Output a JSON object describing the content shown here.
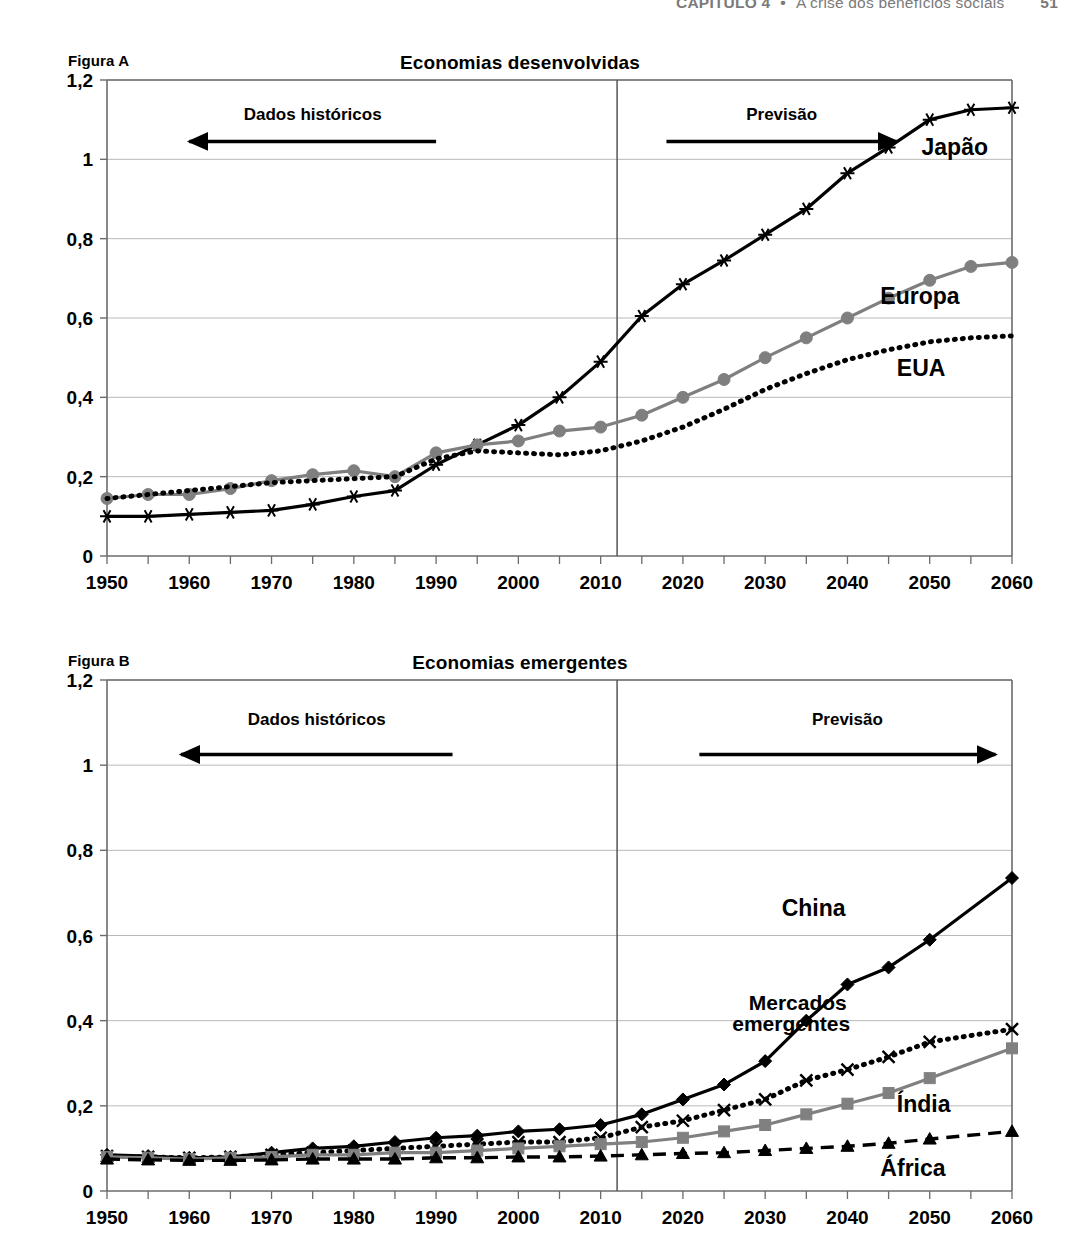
{
  "running_head": {
    "chapter": "CAPÍTULO 4",
    "separator": "•",
    "title": "A crise dos benefícios sociais",
    "page_number": "51"
  },
  "figures": [
    {
      "id": "figura-a",
      "label": "Figura A",
      "title": "Economias desenvolvidas",
      "annotations": {
        "historical": "Dados históricos",
        "forecast": "Previsão"
      },
      "chart_data": {
        "type": "line",
        "title": "Economias desenvolvidas",
        "xlabel": "",
        "ylabel": "",
        "xlim": [
          1950,
          2060
        ],
        "ylim": [
          0,
          1.2
        ],
        "yticks": [
          "0",
          "0,2",
          "0,4",
          "0,6",
          "0,8",
          "1",
          "1,2"
        ],
        "ytick_values": [
          0,
          0.2,
          0.4,
          0.6,
          0.8,
          1.0,
          1.2
        ],
        "xticks": [
          "1950",
          "1960",
          "1970",
          "1980",
          "1990",
          "2000",
          "2010",
          "2020",
          "2030",
          "2040",
          "2050",
          "2060"
        ],
        "xtick_values": [
          1950,
          1960,
          1970,
          1980,
          1990,
          2000,
          2010,
          2020,
          2030,
          2040,
          2050,
          2060
        ],
        "minor_xtick_step": 5,
        "grid": "horizontal",
        "legend_position": "inline-right",
        "forecast_divider_x": 2012,
        "x": [
          1950,
          1955,
          1960,
          1965,
          1970,
          1975,
          1980,
          1985,
          1990,
          1995,
          2000,
          2005,
          2010,
          2015,
          2020,
          2025,
          2030,
          2035,
          2040,
          2045,
          2050,
          2055,
          2060
        ],
        "series": [
          {
            "name": "Japão",
            "color": "#000000",
            "marker": "asterisk",
            "style": "solid",
            "values": [
              0.1,
              0.1,
              0.105,
              0.11,
              0.115,
              0.13,
              0.15,
              0.165,
              0.23,
              0.28,
              0.33,
              0.4,
              0.49,
              0.605,
              0.685,
              0.745,
              0.81,
              0.875,
              0.965,
              1.03,
              1.1,
              1.125,
              1.13
            ]
          },
          {
            "name": "Europa",
            "color": "#7f7f7f",
            "marker": "circle",
            "style": "solid",
            "values": [
              0.145,
              0.155,
              0.155,
              0.17,
              0.19,
              0.205,
              0.215,
              0.2,
              0.26,
              0.28,
              0.29,
              0.315,
              0.325,
              0.355,
              0.4,
              0.445,
              0.5,
              0.55,
              0.6,
              0.65,
              0.695,
              0.73,
              0.74
            ]
          },
          {
            "name": "EUA",
            "color": "#000000",
            "marker": "none",
            "style": "dotted",
            "values": [
              0.145,
              0.155,
              0.165,
              0.175,
              0.185,
              0.19,
              0.195,
              0.2,
              0.245,
              0.265,
              0.26,
              0.255,
              0.265,
              0.29,
              0.325,
              0.37,
              0.42,
              0.46,
              0.495,
              0.52,
              0.54,
              0.55,
              0.555
            ]
          }
        ]
      }
    },
    {
      "id": "figura-b",
      "label": "Figura B",
      "title": "Economias emergentes",
      "annotations": {
        "historical": "Dados históricos",
        "forecast": "Previsão"
      },
      "chart_data": {
        "type": "line",
        "title": "Economias emergentes",
        "xlabel": "",
        "ylabel": "",
        "xlim": [
          1950,
          2060
        ],
        "ylim": [
          0,
          1.2
        ],
        "yticks": [
          "0",
          "0,2",
          "0,4",
          "0,6",
          "0,8",
          "1",
          "1,2"
        ],
        "ytick_values": [
          0,
          0.2,
          0.4,
          0.6,
          0.8,
          1.0,
          1.2
        ],
        "xticks": [
          "1950",
          "1960",
          "1970",
          "1980",
          "1990",
          "2000",
          "2010",
          "2020",
          "2030",
          "2040",
          "2050",
          "2060"
        ],
        "xtick_values": [
          1950,
          1960,
          1970,
          1980,
          1990,
          2000,
          2010,
          2020,
          2030,
          2040,
          2050,
          2060
        ],
        "minor_xtick_step": 5,
        "grid": "horizontal",
        "legend_position": "inline-right",
        "forecast_divider_x": 2012,
        "x": [
          1950,
          1955,
          1960,
          1965,
          1970,
          1975,
          1980,
          1985,
          1990,
          1995,
          2000,
          2005,
          2010,
          2015,
          2020,
          2025,
          2030,
          2035,
          2040,
          2045,
          2050,
          2060
        ],
        "series": [
          {
            "name": "China",
            "color": "#000000",
            "marker": "diamond",
            "style": "solid",
            "values": [
              0.085,
              0.082,
              0.078,
              0.08,
              0.09,
              0.1,
              0.105,
              0.115,
              0.125,
              0.13,
              0.14,
              0.145,
              0.155,
              0.18,
              0.215,
              0.25,
              0.305,
              0.4,
              0.485,
              0.525,
              0.59,
              0.735
            ]
          },
          {
            "name": "Mercados emergentes",
            "color": "#000000",
            "marker": "x",
            "style": "dotted",
            "values": [
              0.082,
              0.08,
              0.078,
              0.08,
              0.085,
              0.09,
              0.095,
              0.1,
              0.105,
              0.11,
              0.115,
              0.115,
              0.125,
              0.15,
              0.165,
              0.19,
              0.215,
              0.26,
              0.285,
              0.315,
              0.35,
              0.38
            ]
          },
          {
            "name": "Índia",
            "color": "#808080",
            "marker": "square",
            "style": "solid",
            "values": [
              0.08,
              0.078,
              0.075,
              0.078,
              0.08,
              0.085,
              0.085,
              0.09,
              0.09,
              0.095,
              0.1,
              0.105,
              0.11,
              0.115,
              0.125,
              0.14,
              0.155,
              0.18,
              0.205,
              0.23,
              0.265,
              0.335
            ]
          },
          {
            "name": "África",
            "color": "#000000",
            "marker": "triangle",
            "style": "dashed",
            "values": [
              0.075,
              0.073,
              0.072,
              0.072,
              0.073,
              0.075,
              0.075,
              0.075,
              0.078,
              0.078,
              0.08,
              0.08,
              0.082,
              0.085,
              0.088,
              0.09,
              0.095,
              0.1,
              0.105,
              0.112,
              0.122,
              0.14
            ]
          }
        ]
      }
    }
  ]
}
